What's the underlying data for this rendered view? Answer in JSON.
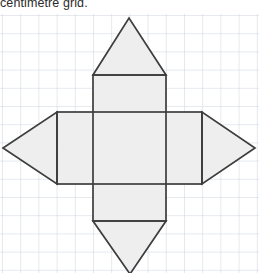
{
  "caption": {
    "text": "centimetre grid."
  },
  "grid": {
    "label": "centimetre grid",
    "cell_size_px": 18.2,
    "origin_x_px": 2,
    "origin_y_px": 1,
    "cols": 14,
    "rows": 15,
    "line_color": "#ced4de",
    "major_line_color": "#c3cad6",
    "background_color": "#ffffff"
  },
  "figure": {
    "name": "net-of-square-based-bipyramid-prism",
    "stroke_color": "#3d3d3d",
    "fill_color": "#eeeeee",
    "stroke_width_px": 1.6,
    "parts": [
      {
        "name": "horizontal-rectangle",
        "shape": "rectangle",
        "points": "57,112 202,112 202,184 57,184"
      },
      {
        "name": "vertical-rectangle",
        "shape": "rectangle",
        "points": "93,75 166,75 166,221 93,221"
      },
      {
        "name": "top-triangle",
        "shape": "triangle",
        "points": "93,75 166,75 129,18"
      },
      {
        "name": "bottom-triangle",
        "shape": "triangle",
        "points": "93,221 166,221 130,274"
      },
      {
        "name": "left-triangle",
        "shape": "triangle",
        "points": "57,112 57,184 3,148"
      },
      {
        "name": "right-triangle",
        "shape": "triangle",
        "points": "202,112 202,184 255,148"
      }
    ],
    "internal_lines": [
      {
        "name": "inner-line-left-vertical",
        "points": "93,112 93,184"
      },
      {
        "name": "inner-line-right-vertical",
        "points": "166,112 166,184"
      },
      {
        "name": "inner-line-top-horizontal",
        "points": "93,112 166,112"
      },
      {
        "name": "inner-line-bottom-horizontal",
        "points": "93,184 166,184"
      }
    ]
  }
}
